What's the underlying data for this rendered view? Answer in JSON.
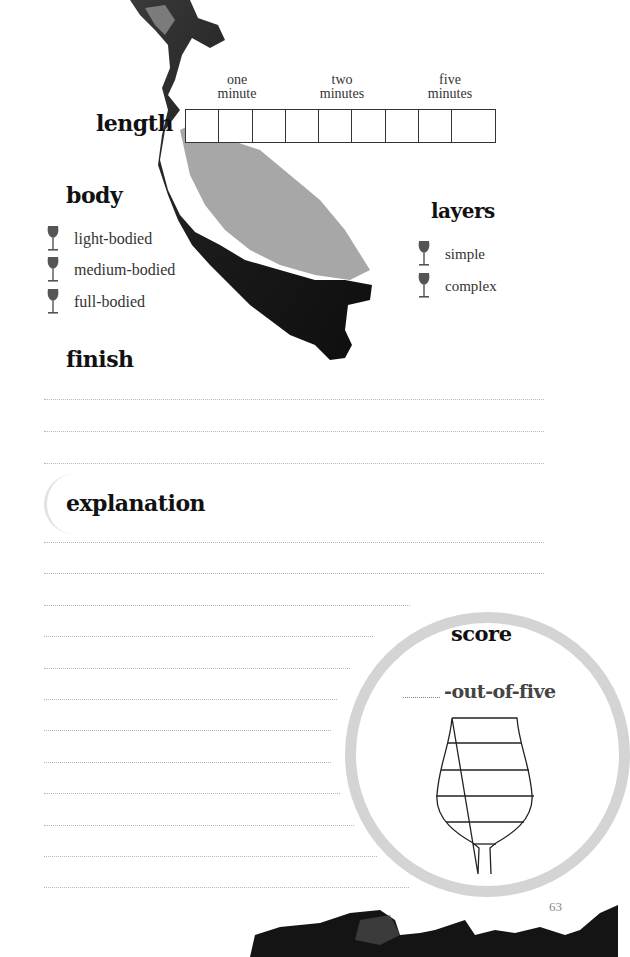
{
  "page": {
    "number": "63",
    "colors": {
      "ink": "#111111",
      "text": "#333333",
      "glass_icon": "#555555",
      "rule": "#b5b5b5",
      "stain": "#cfcfcf"
    }
  },
  "length": {
    "title": "length",
    "markers": [
      {
        "line1": "one",
        "line2": "minute"
      },
      {
        "line1": "two",
        "line2": "minutes"
      },
      {
        "line1": "five",
        "line2": "minutes"
      }
    ],
    "box_count": 9
  },
  "body": {
    "title": "body",
    "options": [
      {
        "icon": "wine-glass-icon",
        "label": "light-bodied"
      },
      {
        "icon": "wine-glass-icon",
        "label": "medium-bodied"
      },
      {
        "icon": "wine-glass-icon",
        "label": "full-bodied"
      }
    ]
  },
  "layers": {
    "title": "layers",
    "options": [
      {
        "icon": "wine-glass-icon",
        "label": "simple"
      },
      {
        "icon": "wine-glass-icon",
        "label": "complex"
      }
    ]
  },
  "finish": {
    "title": "finish",
    "line_count": 3
  },
  "explanation": {
    "title": "explanation",
    "line_count": 12
  },
  "score": {
    "title": "score",
    "suffix": "-out-of-five",
    "glass_levels": 5
  }
}
